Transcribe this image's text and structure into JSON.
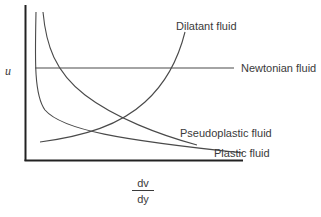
{
  "figure": {
    "type": "diagram",
    "title": "",
    "y_axis_label": "u",
    "x_axis_label": {
      "numerator": "dv",
      "denominator": "dy"
    }
  },
  "curves": [
    {
      "id": "dilatant",
      "label": "Dilatant fluid",
      "trend": "increasing, concave up"
    },
    {
      "id": "newtonian",
      "label": "Newtonian fluid",
      "trend": "constant"
    },
    {
      "id": "pseudoplastic",
      "label": "Pseudoplastic fluid",
      "trend": "decreasing, convex"
    },
    {
      "id": "plastic",
      "label": "Plastic fluid",
      "trend": "sharply decreasing then flattening"
    }
  ],
  "colors": {
    "axis": "#222222",
    "curve": "#4a4a4a",
    "text": "#3a3a3a",
    "background": "#ffffff"
  }
}
